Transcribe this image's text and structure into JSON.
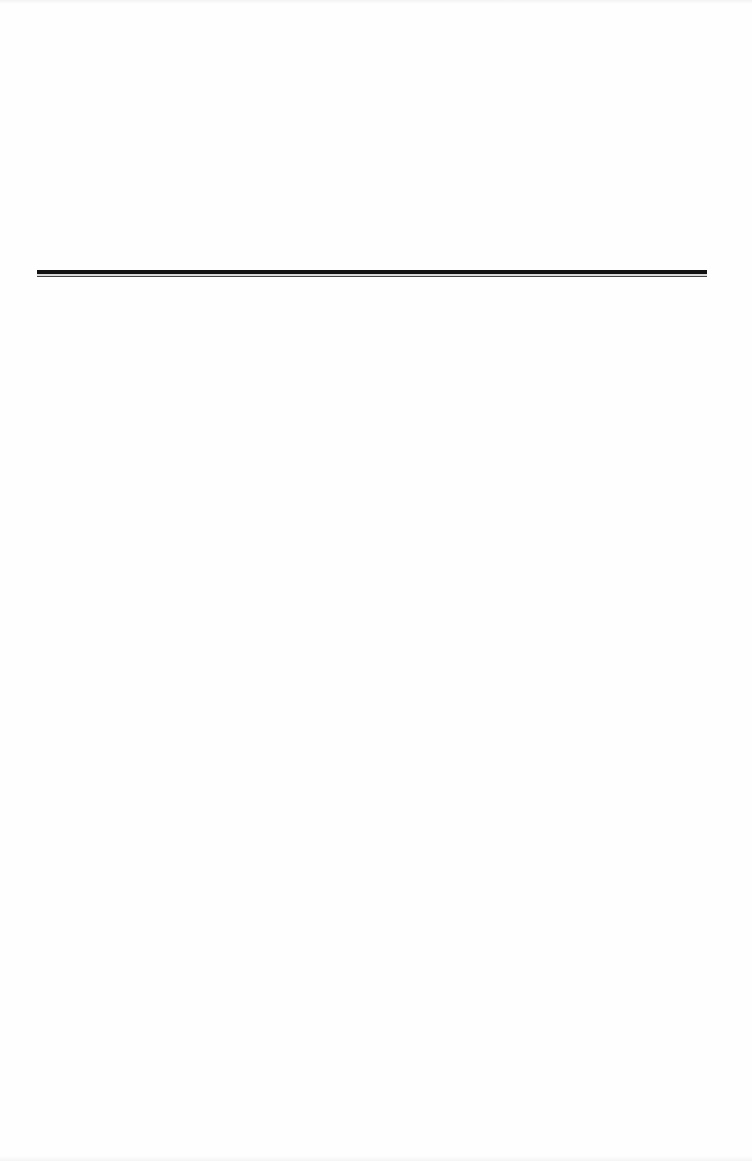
{
  "page": {
    "type": "document-page",
    "background_color": "#fefefe",
    "rule": {
      "style": "double",
      "thick_color": "#111111",
      "thin_color": "#444444"
    }
  }
}
